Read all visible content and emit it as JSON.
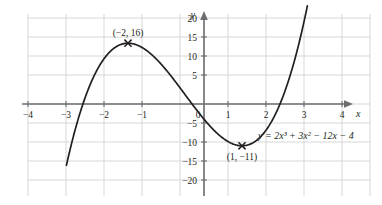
{
  "chart_data": {
    "type": "line",
    "title": "",
    "subtitle": "",
    "xlabel": "x",
    "ylabel": "y",
    "equation": "y = 2x³ + 3x² − 12x − 4",
    "equation_plain": "y = 2x^3 + 3x^2 - 12x - 4",
    "function": {
      "a3": 2,
      "a2": 3,
      "a1": -12,
      "a0": -4
    },
    "xlim": [
      -4.6,
      4.6
    ],
    "ylim": [
      -23,
      23
    ],
    "xticks": [
      -4,
      -3,
      -2,
      -1,
      0,
      1,
      2,
      3,
      4
    ],
    "xtick_labels": [
      "−4",
      "−3",
      "−2",
      "−1",
      "0",
      "1",
      "2",
      "3",
      "4"
    ],
    "yticks": [
      -20,
      -15,
      -10,
      -5,
      5,
      10,
      15,
      20
    ],
    "ytick_labels": [
      "−20",
      "−15",
      "−10",
      "−5",
      "5",
      "10",
      "15",
      "20"
    ],
    "origin_label": "0",
    "grid": true,
    "grid_x_step": 1,
    "grid_y_step": 5,
    "legend": "none",
    "axis_arrows": [
      "x-positive",
      "y-positive"
    ],
    "curve_domain": [
      -3.62,
      2.72
    ],
    "annotations": [
      {
        "name": "local-maximum",
        "label": "(−2, 16)",
        "x": -2,
        "y": 16,
        "marker": "cross",
        "label_position": "above"
      },
      {
        "name": "local-minimum",
        "label": "(1, −11)",
        "x": 1,
        "y": -11,
        "marker": "cross",
        "label_position": "below"
      }
    ],
    "roots_approx": [
      -3.31,
      -0.32,
      1.93
    ],
    "colors": {
      "curve": "#231f20",
      "axis": "#6d6e71",
      "grid": "#d7d7d9",
      "text": "#231f20",
      "background": "#ffffff"
    }
  }
}
